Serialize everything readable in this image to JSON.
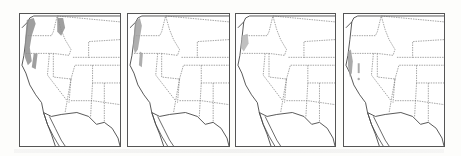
{
  "figure": {
    "type": "small-multiple range maps",
    "region": "Western United States",
    "colors": {
      "border": "#555555",
      "coast": "#444444",
      "state_lines": "#666666",
      "range_fill": "#9a9a9a",
      "background": "#ffffff"
    },
    "panels": [
      {
        "index": 1,
        "range_description": "Coastal Pacific Northwest to northern California plus northern Idaho",
        "shade": "#8f8f8f"
      },
      {
        "index": 2,
        "range_description": "Coastal Washington/Oregon to northern California",
        "shade": "#a0a0a0"
      },
      {
        "index": 3,
        "range_description": "Southern Oregon coast only",
        "shade": "#b5b5b5"
      },
      {
        "index": 4,
        "range_description": "Scattered coastal California and Sierra patches",
        "shade": "#9c9c9c"
      }
    ]
  }
}
